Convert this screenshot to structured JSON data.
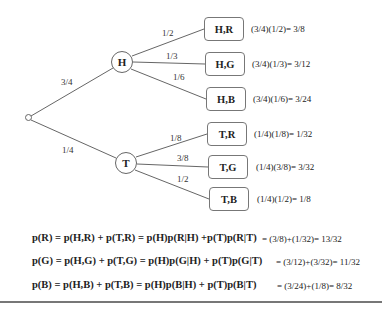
{
  "tree": {
    "root": {
      "label": ""
    },
    "level1": [
      {
        "id": "H",
        "label": "H",
        "edge_prob": "3/4"
      },
      {
        "id": "T",
        "label": "T",
        "edge_prob": "1/4"
      }
    ],
    "leaves": [
      {
        "parent": "H",
        "label": "H,R",
        "edge_prob": "1/2",
        "calc": "(3/4)(1/2)= 3/8"
      },
      {
        "parent": "H",
        "label": "H,G",
        "edge_prob": "1/3",
        "calc": "(3/4)(1/3)= 3/12"
      },
      {
        "parent": "H",
        "label": "H,B",
        "edge_prob": "1/6",
        "calc": "(3/4)(1/6)= 3/24"
      },
      {
        "parent": "T",
        "label": "T,R",
        "edge_prob": "1/8",
        "calc": "(1/4)(1/8)= 1/32"
      },
      {
        "parent": "T",
        "label": "T,G",
        "edge_prob": "3/8",
        "calc": "(1/4)(3/8)= 3/32"
      },
      {
        "parent": "T",
        "label": "T,B",
        "edge_prob": "1/2",
        "calc": "(1/4)(1/2)= 1/8"
      }
    ]
  },
  "formulas": [
    {
      "expr": "p(R) = p(H,R) + p(T,R) = p(H)p(R|H) +p(T)p(R|T)",
      "result": "= (3/8)+(1/32)= 13/32"
    },
    {
      "expr": "p(G) = p(H,G) + p(T,G) = p(H)p(G|H) + p(T)p(G|T)",
      "result": "= (3/12)+(3/32)= 11/32"
    },
    {
      "expr": "p(B) = p(H,B) + p(T,B) = p(H)p(B|H) + p(T)p(B|T)",
      "result": "= (3/24)+(1/8)= 8/32"
    }
  ],
  "colors": {
    "line": "#666666",
    "rule": "#777777",
    "text": "#222222"
  }
}
